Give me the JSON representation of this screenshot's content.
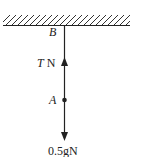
{
  "diagram": {
    "ceiling_label": "B",
    "point_label": "A",
    "tension_label_var": "T",
    "tension_label_unit": " N",
    "weight_label": "0.5gN"
  }
}
